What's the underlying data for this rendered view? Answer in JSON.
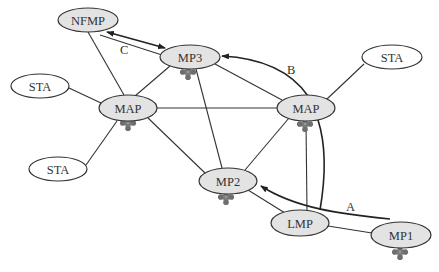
{
  "diagram": {
    "type": "wireless-mesh-network",
    "colors": {
      "mesh_node_fill": "#e3e3e3",
      "station_fill": "#ffffff",
      "stroke": "#333333",
      "antenna": "#7a7a7a"
    },
    "nodes": [
      {
        "id": "nfmp",
        "label": "NFMP",
        "kind": "mesh",
        "cx": 88,
        "cy": 20,
        "rx": 30,
        "ry": 12,
        "antenna": false
      },
      {
        "id": "mp3",
        "label": "MP3",
        "kind": "mesh",
        "cx": 190,
        "cy": 57,
        "rx": 30,
        "ry": 12,
        "antenna": true
      },
      {
        "id": "sta1",
        "label": "STA",
        "kind": "station",
        "cx": 40,
        "cy": 86,
        "rx": 29,
        "ry": 12,
        "antenna": false
      },
      {
        "id": "map1",
        "label": "MAP",
        "kind": "mesh",
        "cx": 128,
        "cy": 108,
        "rx": 29,
        "ry": 13,
        "antenna": true
      },
      {
        "id": "sta2",
        "label": "STA",
        "kind": "station",
        "cx": 58,
        "cy": 169,
        "rx": 29,
        "ry": 12,
        "antenna": false
      },
      {
        "id": "map2",
        "label": "MAP",
        "kind": "mesh",
        "cx": 306,
        "cy": 108,
        "rx": 29,
        "ry": 13,
        "antenna": true
      },
      {
        "id": "sta3",
        "label": "STA",
        "kind": "station",
        "cx": 392,
        "cy": 57,
        "rx": 30,
        "ry": 12,
        "antenna": false
      },
      {
        "id": "mp2",
        "label": "MP2",
        "kind": "mesh",
        "cx": 228,
        "cy": 181,
        "rx": 29,
        "ry": 13,
        "antenna": true
      },
      {
        "id": "lmp",
        "label": "LMP",
        "kind": "mesh",
        "cx": 300,
        "cy": 223,
        "rx": 29,
        "ry": 13,
        "antenna": false
      },
      {
        "id": "mp1",
        "label": "MP1",
        "kind": "mesh",
        "cx": 401,
        "cy": 235,
        "rx": 30,
        "ry": 13,
        "antenna": true
      }
    ],
    "edges": [
      {
        "from": "nfmp",
        "to": "map1"
      },
      {
        "from": "mp3",
        "to": "map1"
      },
      {
        "from": "mp3",
        "to": "map2"
      },
      {
        "from": "mp3",
        "to": "mp2"
      },
      {
        "from": "sta1",
        "to": "map1"
      },
      {
        "from": "sta2",
        "to": "map1"
      },
      {
        "from": "map1",
        "to": "map2"
      },
      {
        "from": "map1",
        "to": "mp2"
      },
      {
        "from": "sta3",
        "to": "map2"
      },
      {
        "from": "map2",
        "to": "mp2"
      },
      {
        "from": "map2",
        "to": "lmp"
      },
      {
        "from": "mp2",
        "to": "lmp"
      },
      {
        "from": "lmp",
        "to": "mp1"
      }
    ],
    "arrows": [
      {
        "id": "A",
        "label": "A",
        "description": "path from MP1 region to MP2",
        "label_x": 346,
        "label_y": 209
      },
      {
        "id": "B",
        "label": "B",
        "description": "path from LMP via MAP to MP3",
        "label_x": 288,
        "label_y": 73
      },
      {
        "id": "C",
        "label": "C",
        "description": "bidirectional NFMP to MP3",
        "label_x": 124,
        "label_y": 52
      }
    ]
  }
}
